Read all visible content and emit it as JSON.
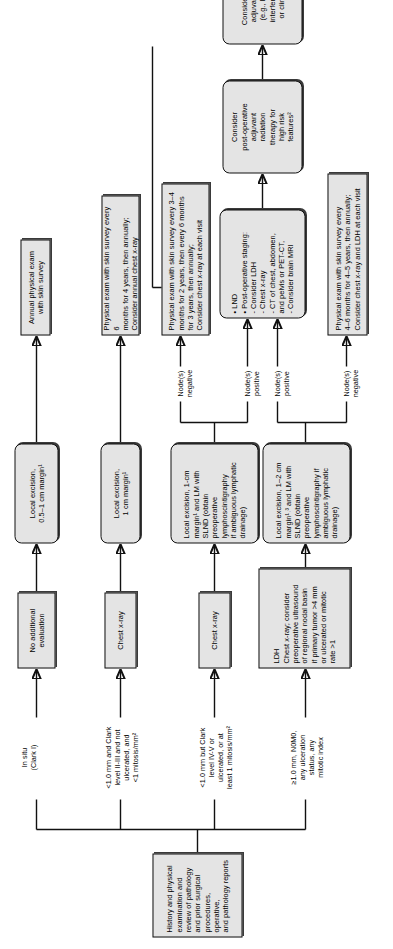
{
  "diagram": {
    "orientation": "rotated-90-ccw",
    "accent_color": "#e4e4e4",
    "line_color": "#111111"
  },
  "start": {
    "label": "History and physical\nexamination and\nreview of pathology\nand prior surgical\nprocedures, operative,\nand pathology reports"
  },
  "branches": [
    {
      "id": "b1",
      "label": "In situ\n(Clark I)"
    },
    {
      "id": "b2",
      "label": "<1.0 mm and Clark\nlevel II-III and not\nulcerated, and\n<1 mitosis/mm²"
    },
    {
      "id": "b3",
      "label": "<1.0 mm but Clark\nlevel IV-V or\nulcerated, or at\nleast 1 mitosis/mm²"
    },
    {
      "id": "b4",
      "label": "≥1.0 mm, N0M0,\nany ulceration\nstatus, any\nmitotic index"
    }
  ],
  "workup": [
    {
      "id": "w1",
      "label": "No additional\nevaluation"
    },
    {
      "id": "w2",
      "label": "Chest x-ray"
    },
    {
      "id": "w3",
      "label": "Chest x-ray"
    },
    {
      "id": "w4",
      "label": "LDH\nChest x-ray; consider\npreoperative ultrasound\nof regional nodal basin\nif primary tumor >4 mm\nor ulcerated or mitotic\nrate >1"
    }
  ],
  "treatment": [
    {
      "id": "t1",
      "label": "Local excision,\n0.5–1 cm margin¹"
    },
    {
      "id": "t2",
      "label": "Local excision,\n1 cm margin¹"
    },
    {
      "id": "t3",
      "label": "Local excision, 1-cm\nmargin¹ and LM with\nSLND (obtain\npreoperative\nlymphoscintigraphy\nif ambiguous lymphatic\ndrainage)"
    },
    {
      "id": "t4",
      "label": "Local excision, 1–2 cm\nmargin¹˒³ and LM with\nSLND (obtain\npreoperative\nlymphoscintigraphy if\nambiguous lymphatic\ndrainage)"
    }
  ],
  "node_status": [
    {
      "id": "n1",
      "label": "Node(s)\nnegative"
    },
    {
      "id": "n2",
      "label": "Node(s)\npositive"
    },
    {
      "id": "n3",
      "label": "Node(s)\npositive"
    },
    {
      "id": "n4",
      "label": "Node(s)\nnegative"
    }
  ],
  "followup": [
    {
      "id": "f1",
      "label": "Annual physical exam\nwith skin survey"
    },
    {
      "id": "f2",
      "label": "Physical exam with skin survey every 6\nmonths for 4 years, then annually;\nConsider annual chest x-ray"
    },
    {
      "id": "f3",
      "label": "Physical exam with skin survey every 3–4\nmonths for 2 years, then every 6 months\nfor 3 years, then annually;\nConsider chest x-ray at each visit"
    },
    {
      "id": "f4",
      "label": "Physical exam with skin survey every\n4–6 months for 4–5 years, then annually;\nConsider chest x-ray and LDH at each visit"
    }
  ],
  "advanced": [
    {
      "id": "a1",
      "label": "• LND\n• Post-operative staging:\n   - Consider LDH\n   - Chest x-ray\n   - CT of chest, abdomen,\n     and pelvis or PET-CT,\n   - Consider brain MRI"
    },
    {
      "id": "a2",
      "label": "Consider\npost-operative\nadjuvant\nradiation\ntherapy for\nhigh risk\nfeatures²"
    },
    {
      "id": "a3",
      "label": "Consider systemic\nadjuvant therapy\n(e.g., high-dose\ninterferon-alpha⁴\nor clinical trial)"
    }
  ]
}
